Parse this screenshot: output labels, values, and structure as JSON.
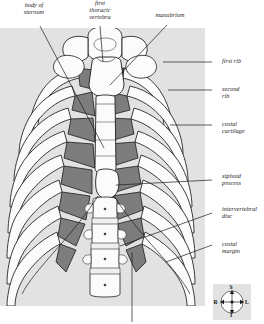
{
  "figure": {
    "band_color": "#e2e2e2",
    "bone_light": "#fbfbfb",
    "bone_shade": "#d8d8d8",
    "cartilage_dark": "#7d7d7d",
    "cartilage_mid": "#a8a8a8",
    "outline": "#1c1c1c",
    "background": "#ffffff"
  },
  "labels": {
    "body_of_sternum": "body of\nsternum",
    "first_thoracic_vertebra": "first\nthoracic\nvertebra",
    "manubrium": "manubrium",
    "first_rib": "first rib",
    "second_rib": "second\nrib",
    "costal_cartilage": "costal\ncartilage",
    "xiphoid_process": "xiphoid\nprocess",
    "intervertebral_disc": "intervertebral\ndisc",
    "costal_margin": "costal\nmargin"
  },
  "compass": {
    "superior": "S",
    "inferior": "I",
    "right": "R",
    "left": "L"
  }
}
